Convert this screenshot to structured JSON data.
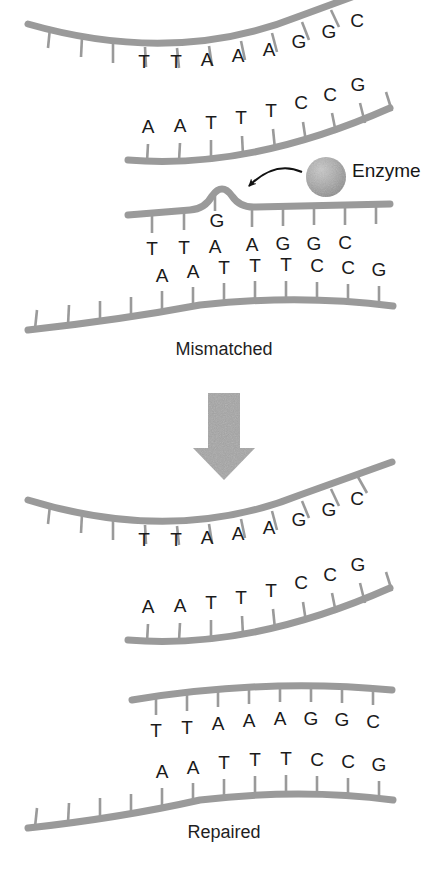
{
  "figure": {
    "background_color": "#ffffff",
    "strand_color": "#9a9a9a",
    "stem_color": "#9a9a9a",
    "letter_color": "#1a1a1a",
    "arrow_color": "#a6a6a6",
    "enzyme_color": "#a8a8a8",
    "pointer_color": "#111111"
  },
  "labels": {
    "enzyme": "Enzyme",
    "mismatched": "Mismatched",
    "repaired": "Repaired"
  },
  "panels": [
    {
      "id": "separated-strands-top",
      "name": "unrepaired-separated-strands",
      "top_strand": {
        "name": "top-strand-bases",
        "bases": [
          "T",
          "T",
          "A",
          "A",
          "A",
          "G",
          "G",
          "C"
        ]
      },
      "bottom_strand": {
        "name": "bottom-strand-bases",
        "bases": [
          "A",
          "A",
          "T",
          "T",
          "T",
          "C",
          "C",
          "G"
        ]
      }
    },
    {
      "id": "mismatched-duplex",
      "name": "mismatched-duplex",
      "label": "Mismatched",
      "top_strand": {
        "name": "top-strand-bases",
        "bases": [
          "T",
          "T",
          "A",
          "G",
          "A",
          "G",
          "G",
          "C"
        ],
        "mismatch_index": 3,
        "mismatch_base": "G"
      },
      "bottom_strand": {
        "name": "bottom-strand-bases",
        "bases": [
          "A",
          "A",
          "T",
          "T",
          "T",
          "C",
          "C",
          "G"
        ]
      }
    },
    {
      "id": "separated-strands-bottom",
      "name": "repairing-separated-strands",
      "top_strand": {
        "name": "top-strand-bases",
        "bases": [
          "T",
          "T",
          "A",
          "A",
          "A",
          "G",
          "G",
          "C"
        ]
      },
      "bottom_strand": {
        "name": "bottom-strand-bases",
        "bases": [
          "A",
          "A",
          "T",
          "T",
          "T",
          "C",
          "C",
          "G"
        ]
      }
    },
    {
      "id": "repaired-duplex",
      "name": "repaired-duplex",
      "label": "Repaired",
      "top_strand": {
        "name": "top-strand-bases",
        "bases": [
          "T",
          "T",
          "A",
          "A",
          "A",
          "G",
          "G",
          "C"
        ]
      },
      "bottom_strand": {
        "name": "bottom-strand-bases",
        "bases": [
          "A",
          "A",
          "T",
          "T",
          "T",
          "C",
          "C",
          "G"
        ]
      }
    }
  ],
  "process_arrow": {
    "name": "process-down-arrow",
    "direction": "down"
  }
}
